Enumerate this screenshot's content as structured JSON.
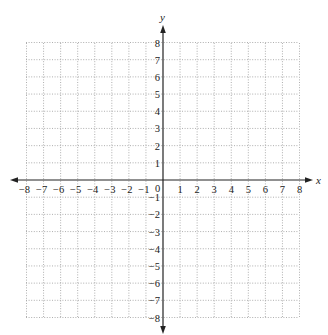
{
  "chart_data": {
    "type": "coordinate-grid",
    "title": "",
    "xlabel": "x",
    "ylabel": "y",
    "xlim": [
      -8,
      8
    ],
    "ylim": [
      -8,
      8
    ],
    "grid": true,
    "grid_style": "dotted",
    "x_ticks": [
      -8,
      -7,
      -6,
      -5,
      -4,
      -3,
      -2,
      -1,
      0,
      1,
      2,
      3,
      4,
      5,
      6,
      7,
      8
    ],
    "y_ticks": [
      -8,
      -7,
      -6,
      -5,
      -4,
      -3,
      -2,
      -1,
      1,
      2,
      3,
      4,
      5,
      6,
      7,
      8
    ],
    "origin_label": "0",
    "series": []
  },
  "colors": {
    "axis": "#222222",
    "grid": "#9a9a9a",
    "text": "#222222",
    "background": "#ffffff"
  },
  "layout": {
    "grid_left": 26,
    "grid_right": 299,
    "grid_top": 43,
    "grid_bottom": 318,
    "origin_x": 163,
    "origin_y": 180
  }
}
